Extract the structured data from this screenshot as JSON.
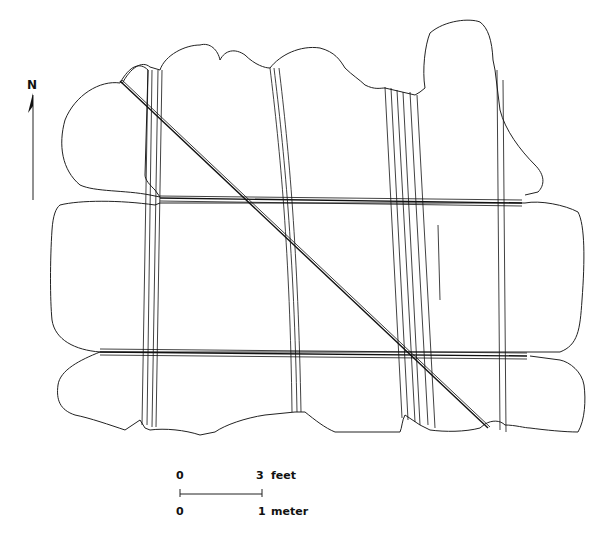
{
  "diagram": {
    "north_label": "N",
    "scale": {
      "top_left": "0",
      "top_right": "3",
      "top_unit": "feet",
      "bottom_left": "0",
      "bottom_right": "1",
      "bottom_unit": "meter"
    }
  }
}
